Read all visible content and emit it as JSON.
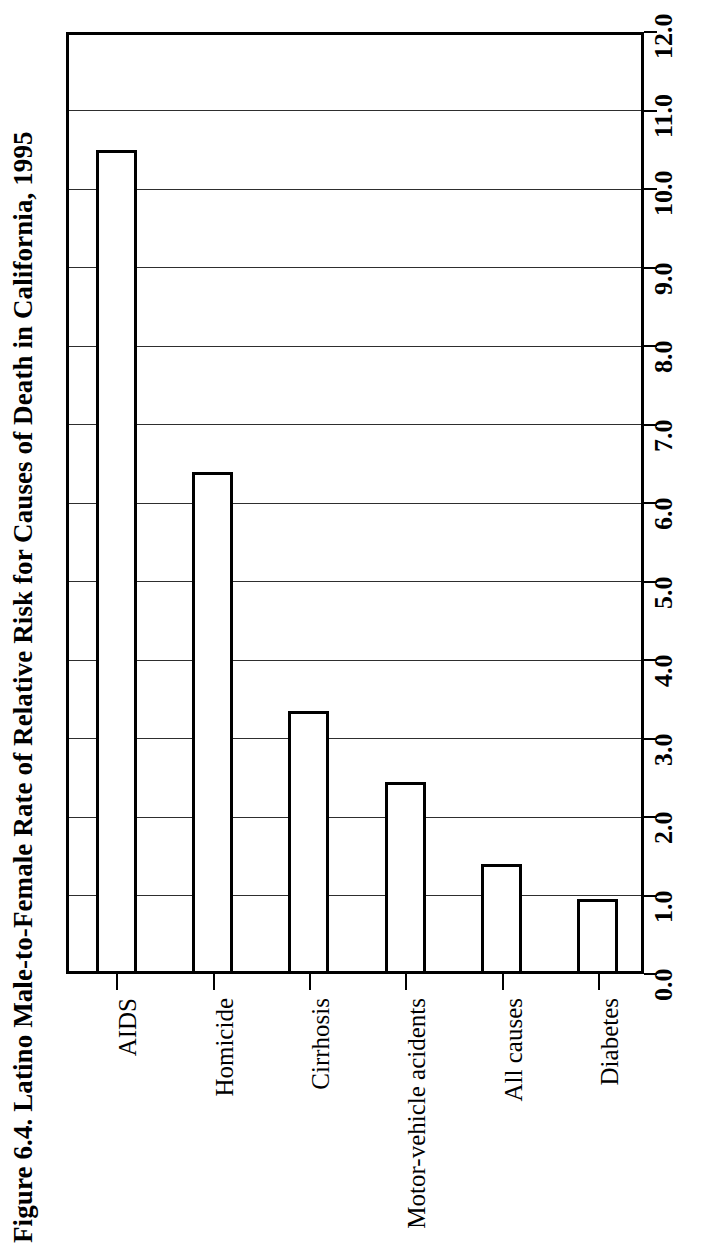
{
  "figure": {
    "title": "Figure 6.4. Latino Male-to-Female Rate of Relative Risk for Causes of Death in California, 1995"
  },
  "chart_data": {
    "type": "bar",
    "orientation": "vertical",
    "title": "Figure 6.4. Latino Male-to-Female Rate of Relative Risk for Causes of Death in California, 1995",
    "xlabel": "",
    "ylabel": "",
    "categories": [
      "AIDS",
      "Homicide",
      "Cirrhosis",
      "Motor-vehicle acidents",
      "All causes",
      "Diabetes"
    ],
    "values": [
      10.5,
      6.4,
      3.35,
      2.45,
      1.4,
      0.95
    ],
    "ylim": [
      0.0,
      12.0
    ],
    "ytick_labels": [
      "0.0",
      "1.0",
      "2.0",
      "3.0",
      "4.0",
      "5.0",
      "6.0",
      "7.0",
      "8.0",
      "9.0",
      "10.0",
      "11.0",
      "12.0"
    ],
    "ytick_values": [
      0.0,
      1.0,
      2.0,
      3.0,
      4.0,
      5.0,
      6.0,
      7.0,
      8.0,
      9.0,
      10.0,
      11.0,
      12.0
    ],
    "grid": true,
    "legend": null,
    "bar_fill_color": "#ffffff",
    "bar_edge_color": "#000000",
    "axis_color": "#000000",
    "background_color": "#ffffff",
    "page_rotation_note": "entire figure is printed rotated 90 degrees counter-clockwise"
  }
}
